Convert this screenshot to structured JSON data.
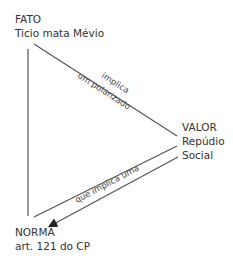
{
  "nodes": {
    "fato": {
      "title": "FATO",
      "subtitle": "Ticio mata Mévio"
    },
    "valor": {
      "title": "VALOR",
      "line2": "Repúdio",
      "line3": "Social"
    },
    "norma": {
      "title": "NORMA",
      "subtitle": "art. 121 do CP"
    }
  },
  "edges": {
    "fato_valor": {
      "line1": "implica",
      "line2": "um polarizado"
    },
    "valor_norma": {
      "label": "que implica uma"
    }
  },
  "colors": {
    "line": "#555555",
    "text": "#333333",
    "background": "#ffffff"
  }
}
